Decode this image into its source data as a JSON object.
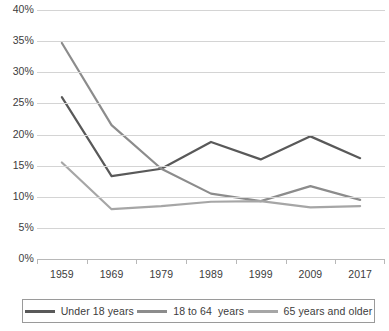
{
  "chart_data": {
    "type": "line",
    "title": "",
    "xlabel": "",
    "ylabel": "",
    "x": [
      "1959",
      "1969",
      "1979",
      "1989",
      "1999",
      "2009",
      "2017"
    ],
    "categories": [
      "1959",
      "1969",
      "1979",
      "1989",
      "1999",
      "2009",
      "2017"
    ],
    "ylim": [
      0,
      40
    ],
    "ytick_labels": [
      "40%",
      "35%",
      "30%",
      "25%",
      "20%",
      "15%",
      "10%",
      "5%",
      "0%"
    ],
    "ytick_values": [
      40,
      35,
      30,
      25,
      20,
      15,
      10,
      5,
      0
    ],
    "grid": true,
    "legend_position": "bottom",
    "series": [
      {
        "name": "Under 18 years",
        "color": "#595959",
        "values": [
          26.0,
          13.3,
          14.5,
          18.8,
          16.0,
          19.7,
          16.2
        ]
      },
      {
        "name": "18 to 64  years",
        "color": "#8c8c8c",
        "values": [
          34.7,
          21.5,
          14.5,
          10.5,
          9.3,
          11.7,
          9.5
        ]
      },
      {
        "name": "65 years and older",
        "color": "#a6a6a6",
        "values": [
          15.5,
          8.0,
          8.5,
          9.2,
          9.3,
          8.3,
          8.5
        ]
      }
    ]
  },
  "legend": {
    "items": [
      {
        "label": "Under 18 years",
        "color": "#595959"
      },
      {
        "label": "18 to 64  years",
        "color": "#8c8c8c"
      },
      {
        "label": "65 years and older",
        "color": "#a6a6a6"
      }
    ]
  },
  "colors": {
    "gridline": "#d4d4d4",
    "axis": "#b8b8b8",
    "text": "#3c3c3c",
    "background": "#ffffff"
  }
}
